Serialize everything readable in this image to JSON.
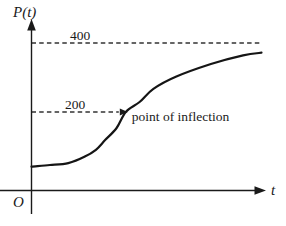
{
  "figure": {
    "background": "#ffffff",
    "ink": "#1a1a1a",
    "dash_color": "#333333",
    "labels": {
      "y_axis": "P(t)",
      "x_axis": "t",
      "origin": "O",
      "asymptote": "400",
      "inflection_level": "200",
      "annotation": "point of inflection"
    }
  },
  "chart_data": {
    "type": "line",
    "title": "",
    "xlabel": "t",
    "ylabel": "P(t)",
    "grid": false,
    "legend": false,
    "ylim": [
      0,
      440
    ],
    "asymptote": 400,
    "inflection": {
      "t": 4.1,
      "P": 200
    },
    "initial_value": 60,
    "reference_levels": [
      400,
      200
    ],
    "annotations": [
      {
        "text": "point of inflection",
        "at": {
          "t": 4.1,
          "P": 200
        }
      }
    ],
    "series": [
      {
        "name": "P(t)",
        "style": "solid",
        "points": [
          [
            0,
            60
          ],
          [
            0.8,
            64
          ],
          [
            1.6,
            69
          ],
          [
            2.3,
            85
          ],
          [
            2.8,
            103
          ],
          [
            3.2,
            128
          ],
          [
            3.7,
            159
          ],
          [
            4.1,
            200
          ],
          [
            4.7,
            229
          ],
          [
            5.3,
            267
          ],
          [
            6.3,
            303
          ],
          [
            7.8,
            339
          ],
          [
            9.2,
            364
          ],
          [
            10,
            372
          ]
        ]
      }
    ]
  }
}
